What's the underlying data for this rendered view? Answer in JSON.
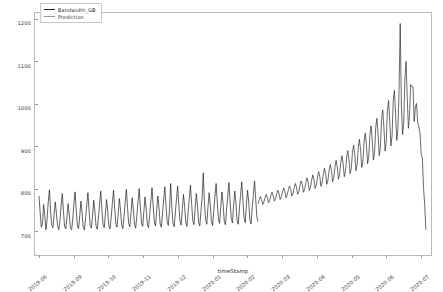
{
  "chart_data": {
    "type": "line",
    "title": "",
    "xlabel": "timeStamp",
    "ylabel": "",
    "grid": false,
    "legend_position": "upper-left",
    "ylim": [
      640,
      1215
    ],
    "yticks": [
      700,
      800,
      900,
      1000,
      1100,
      1200
    ],
    "ytick_labels": [
      "700",
      "800",
      "900",
      "1000",
      "1100",
      "1200"
    ],
    "xticks": [
      "2019-08",
      "2019-09",
      "2019-10",
      "2019-11",
      "2019-12",
      "2020-01",
      "2020-02",
      "2020-03",
      "2020-04",
      "2020-05",
      "2020-06",
      "2020-07"
    ],
    "xtick_labels": [
      "2019-08",
      "2019-09",
      "2019-10",
      "2019-11",
      "2019-12",
      "2020-01",
      "2020-02",
      "2020-03",
      "2020-04",
      "2020-05",
      "2020-06",
      "2020-07"
    ],
    "xlim": [
      "2019-08-01",
      "2020-07-10"
    ],
    "series": [
      {
        "name": "Bandwidth_GB",
        "color": "#1f1f1f",
        "values": [
          780,
          742,
          706,
          714,
          760,
          733,
          700,
          726,
          768,
          795,
          742,
          711,
          705,
          736,
          766,
          738,
          709,
          700,
          722,
          757,
          786,
          744,
          707,
          702,
          730,
          762,
          735,
          705,
          700,
          725,
          764,
          790,
          745,
          708,
          703,
          733,
          768,
          740,
          706,
          700,
          727,
          759,
          788,
          746,
          710,
          704,
          735,
          770,
          742,
          708,
          701,
          728,
          761,
          792,
          748,
          712,
          705,
          737,
          772,
          744,
          709,
          702,
          730,
          763,
          794,
          750,
          713,
          706,
          739,
          774,
          746,
          711,
          703,
          732,
          765,
          796,
          752,
          715,
          707,
          741,
          776,
          748,
          712,
          704,
          734,
          767,
          798,
          754,
          716,
          708,
          743,
          778,
          750,
          713,
          705,
          736,
          769,
          800,
          756,
          718,
          709,
          745,
          780,
          752,
          714,
          706,
          738,
          771,
          802,
          758,
          719,
          710,
          747,
          810,
          754,
          715,
          707,
          740,
          773,
          804,
          760,
          721,
          711,
          749,
          784,
          756,
          716,
          708,
          742,
          775,
          806,
          762,
          722,
          712,
          751,
          786,
          758,
          718,
          709,
          744,
          777,
          835,
          764,
          724,
          713,
          753,
          788,
          760,
          719,
          710,
          746,
          779,
          810,
          766,
          725,
          715,
          755,
          790,
          762,
          720,
          712,
          748,
          781,
          812,
          768,
          727,
          716,
          757,
          792,
          764,
          722,
          713,
          750,
          783,
          814,
          770,
          728,
          717,
          759,
          794,
          766,
          723,
          714,
          752,
          785,
          816,
          772,
          730,
          719
        ],
        "start": "2019-08-01"
      },
      {
        "name": "Prediction",
        "color": "#9a9a9a",
        "values": [
          762,
          770,
          779,
          772,
          760,
          766,
          776,
          784,
          776,
          764,
          770,
          781,
          789,
          781,
          768,
          774,
          785,
          794,
          786,
          772,
          778,
          790,
          799,
          791,
          776,
          782,
          795,
          804,
          796,
          780,
          787,
          800,
          810,
          801,
          784,
          791,
          806,
          816,
          807,
          789,
          796,
          812,
          823,
          813,
          793,
          801,
          818,
          830,
          819,
          798,
          806,
          825,
          838,
          826,
          803,
          812,
          833,
          846,
          833,
          808,
          818,
          841,
          855,
          841,
          814,
          824,
          850,
          865,
          849,
          820,
          831,
          860,
          876,
          858,
          826,
          838,
          871,
          888,
          868,
          833,
          846,
          883,
          901,
          878,
          840,
          854,
          896,
          915,
          889,
          848,
          863,
          910,
          930,
          901,
          857,
          873,
          926,
          947,
          914,
          866,
          884,
          943,
          965,
          928,
          876,
          896,
          962,
          985,
          943,
          887,
          909,
          983,
          1007,
          959,
          899,
          923,
          1006,
          1031,
          977,
          912,
          938,
          1031,
          1190,
          996,
          926,
          955,
          1058,
          1100,
          1017,
          941,
          973,
          1045,
          1040,
          1039,
          957,
          993,
          1000,
          955,
          944,
          930,
          880,
          870,
          800,
          760,
          700
        ]
      }
    ],
    "annotations": {
      "peak_value": 1190,
      "peak_period": "2020-06"
    }
  },
  "legend": {
    "items": [
      {
        "label": "Bandwidth_GB",
        "color": "#1f1f1f"
      },
      {
        "label": "Prediction",
        "color": "#9a9a9a"
      }
    ]
  },
  "axes": {
    "xlabel": "timeStamp"
  }
}
